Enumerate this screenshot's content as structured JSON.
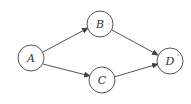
{
  "diagram": {
    "type": "directed-graph",
    "nodes": [
      {
        "id": "A",
        "label": "A",
        "x": 31,
        "y": 58
      },
      {
        "id": "B",
        "label": "B",
        "x": 100,
        "y": 24
      },
      {
        "id": "C",
        "label": "C",
        "x": 102,
        "y": 80
      },
      {
        "id": "D",
        "label": "D",
        "x": 170,
        "y": 61,
        "superscript": "o"
      }
    ],
    "edges": [
      {
        "from": "A",
        "to": "B"
      },
      {
        "from": "A",
        "to": "C"
      },
      {
        "from": "B",
        "to": "D"
      },
      {
        "from": "C",
        "to": "D"
      }
    ],
    "colors": {
      "stroke": "#444444",
      "background": "#ffffff"
    }
  }
}
